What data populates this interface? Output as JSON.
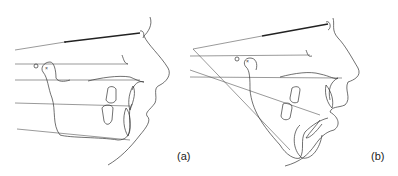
{
  "figure": {
    "panels": [
      {
        "id": "a",
        "label": "(a)",
        "description": "Cephalometric tracing, lateral profile with parallel horizontal reference lines"
      },
      {
        "id": "b",
        "label": "(b)",
        "description": "Cephalometric tracing, lateral profile with converging reference lines from a posterior point"
      }
    ],
    "markers": {
      "circle": "o",
      "cross": "×"
    },
    "colors": {
      "line": "#333333",
      "background": "#ffffff"
    }
  }
}
